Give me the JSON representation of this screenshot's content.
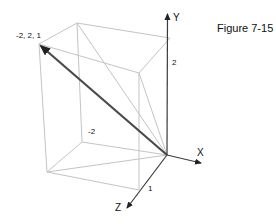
{
  "figure": {
    "caption": "Figure 7-15",
    "axes": {
      "x_label": "X",
      "y_label": "Y",
      "z_label": "Z"
    },
    "ticks": {
      "x_tick": "-2",
      "y_tick": "2",
      "z_tick": "1"
    },
    "vector": {
      "from": [
        0,
        0,
        0
      ],
      "to": [
        -2,
        2,
        1
      ],
      "label": "-2, 2, 1"
    },
    "box": {
      "x_range": [
        -2,
        0
      ],
      "y_range": [
        0,
        2
      ],
      "z_range": [
        0,
        1
      ]
    },
    "colors": {
      "edge": "#c4c4c4",
      "axis": "#3a3a3a",
      "vector": "#4a4a4a"
    }
  }
}
